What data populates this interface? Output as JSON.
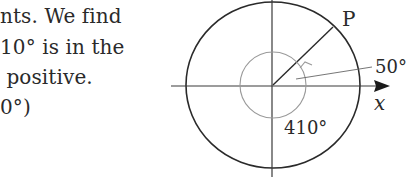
{
  "text": {
    "lines": [
      "nts. We find",
      "10° is in the",
      " positive.",
      "0°)"
    ]
  },
  "figure": {
    "point_label": "P",
    "reference_angle_label": "50°",
    "total_angle_label": "410°",
    "axis_label": "x"
  }
}
